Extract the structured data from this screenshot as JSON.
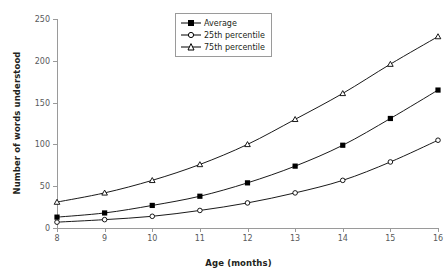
{
  "chart_data": {
    "type": "line",
    "title": "",
    "xlabel": "Age (months)",
    "ylabel": "Number of words understood",
    "x": [
      8,
      9,
      10,
      11,
      12,
      13,
      14,
      15,
      16
    ],
    "categories": [
      "8",
      "9",
      "10",
      "11",
      "12",
      "13",
      "14",
      "15",
      "16"
    ],
    "xlim": [
      8,
      16
    ],
    "ylim": [
      0,
      250
    ],
    "yticks": [
      0,
      50,
      100,
      150,
      200,
      250
    ],
    "xticks": [
      8,
      9,
      10,
      11,
      12,
      13,
      14,
      15,
      16
    ],
    "grid": false,
    "legend_position": "top-center",
    "series": [
      {
        "name": "Average",
        "marker": "filled-square",
        "color": "#000000",
        "values": [
          13,
          18,
          27,
          38,
          54,
          74,
          99,
          131,
          165
        ]
      },
      {
        "name": "25th percentile",
        "marker": "open-circle",
        "color": "#000000",
        "values": [
          7,
          10,
          14,
          21,
          30,
          42,
          57,
          79,
          105
        ]
      },
      {
        "name": "75th percentile",
        "marker": "open-triangle",
        "color": "#000000",
        "values": [
          31,
          42,
          57,
          76,
          100,
          130,
          161,
          196,
          229
        ]
      }
    ]
  },
  "axis": {
    "y_tick_labels": [
      "0",
      "50",
      "100",
      "150",
      "200",
      "250"
    ],
    "x_tick_labels": [
      "8",
      "9",
      "10",
      "11",
      "12",
      "13",
      "14",
      "15",
      "16"
    ],
    "y_axis_title": "Number of words understood",
    "x_axis_title": "Age (months)"
  },
  "legend": {
    "items": [
      {
        "label": "Average",
        "marker": "filled-square"
      },
      {
        "label": "25th percentile",
        "marker": "open-circle"
      },
      {
        "label": "75th percentile",
        "marker": "open-triangle"
      }
    ]
  },
  "colors": {
    "line": "#000000",
    "axis": "#9a9a9a",
    "tick_text": "#58595b",
    "title_text": "#231f20",
    "background": "#ffffff"
  }
}
